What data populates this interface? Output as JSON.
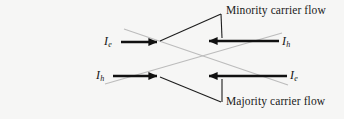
{
  "figure": {
    "name": "carrier-flow-diagram",
    "background_color": "#f6f6f5",
    "captions": {
      "minority": "Minority carrier flow",
      "majority": "Majority carrier flow"
    },
    "currents": {
      "top_left": {
        "symbol": "I",
        "subscript": "e",
        "direction": "right"
      },
      "top_right": {
        "symbol": "I",
        "subscript": "h",
        "direction": "left"
      },
      "bottom_left": {
        "symbol": "I",
        "subscript": "h",
        "direction": "right"
      },
      "bottom_right": {
        "symbol": "I",
        "subscript": "e",
        "direction": "left"
      }
    },
    "colors": {
      "arrow": "#111111",
      "leader": "#1a1a1a",
      "diagonal": "#b9b9b9",
      "text": "#1a1a1a"
    }
  }
}
